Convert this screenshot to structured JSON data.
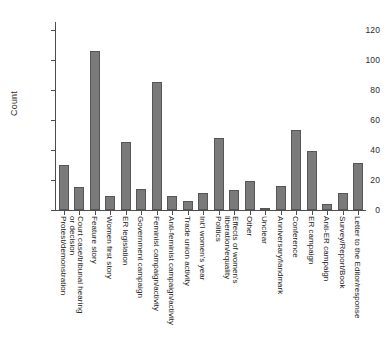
{
  "chart_data": {
    "type": "bar",
    "title": "",
    "xlabel": "",
    "ylabel": "Count",
    "ylim": [
      0,
      125
    ],
    "yticks": [
      0,
      20,
      40,
      60,
      80,
      100,
      120
    ],
    "ytick_labels": [
      "0",
      "20",
      "40",
      "60",
      "80",
      "100",
      "120"
    ],
    "grid": false,
    "legend": null,
    "orientation": "vertical",
    "bar_color": "#7a7a7a",
    "bar_edge_color": "#565656",
    "axis_color": "#4d4d4d",
    "background_color": "#ffffff",
    "xtick_label_rotation": 90,
    "categories": [
      "Protest/demonstration",
      "Court case/tribunal hearing or decision",
      "Feature story",
      "Women first story",
      "ER legislation",
      "Government campaign",
      "Feminist campaign/activity",
      "Anti-feminist campaign/activity",
      "Trade union activity",
      "Int'l women's year",
      "Politics",
      "Effects of women's liberation/equality",
      "Other",
      "Unclear",
      "Anniversary/landmark",
      "Conference",
      "ER campaign",
      "Anti-ER campaign",
      "Survey/Report/Book",
      "Letter to the Editor/response"
    ],
    "category_lines": [
      [
        "Protest/demonstration"
      ],
      [
        "Court case/tribunal hearing",
        "or decision"
      ],
      [
        "Feature story"
      ],
      [
        "Women first story"
      ],
      [
        "ER legislation"
      ],
      [
        "Government campaign"
      ],
      [
        "Feminist campaign/activity"
      ],
      [
        "Anti-feminist campaign/activity"
      ],
      [
        "Trade union activity"
      ],
      [
        "Int'l women's year"
      ],
      [
        "Politics"
      ],
      [
        "Effects of women's",
        "liberation/equality"
      ],
      [
        "Other"
      ],
      [
        "Unclear"
      ],
      [
        "Anniversary/landmark"
      ],
      [
        "Conference"
      ],
      [
        "ER campaign"
      ],
      [
        "Anti-ER campaign"
      ],
      [
        "Survey/Report/Book"
      ],
      [
        "Letter to the Editor/response"
      ]
    ],
    "values": [
      30,
      15,
      106,
      9,
      45,
      14,
      85,
      9,
      6,
      11,
      48,
      13,
      19,
      1.5,
      16,
      53,
      39,
      4,
      11,
      31
    ]
  }
}
